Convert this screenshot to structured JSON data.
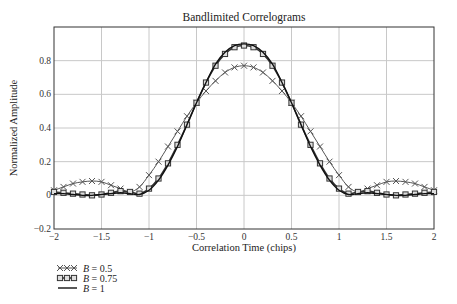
{
  "chart_data": {
    "type": "line",
    "title": "Bandlimited Correlograms",
    "xlabel": "Correlation Time (chips)",
    "ylabel": "Normalized Amplitude",
    "xlim": [
      -2,
      2
    ],
    "ylim": [
      -0.2,
      1.0
    ],
    "grid": true,
    "legend_position": "bottom-left, below plot",
    "x_ticks": [
      -2,
      -1.5,
      -1,
      -0.5,
      0,
      0.5,
      1,
      1.5,
      2
    ],
    "x_tick_labels": [
      "−2",
      "−1.5",
      "−1",
      "−0.5",
      "0",
      "0.5",
      "1",
      "1.5",
      "2"
    ],
    "y_ticks": [
      -0.2,
      0,
      0.2,
      0.4,
      0.6,
      0.8
    ],
    "y_tick_labels": [
      "−0.2",
      "0",
      "0.2",
      "0.4",
      "0.6",
      "0.8"
    ],
    "x": [
      -2.0,
      -1.9,
      -1.8,
      -1.7,
      -1.6,
      -1.5,
      -1.4,
      -1.3,
      -1.2,
      -1.1,
      -1.0,
      -0.9,
      -0.8,
      -0.7,
      -0.6,
      -0.5,
      -0.4,
      -0.3,
      -0.2,
      -0.1,
      0.0,
      0.1,
      0.2,
      0.3,
      0.4,
      0.5,
      0.6,
      0.7,
      0.8,
      0.9,
      1.0,
      1.1,
      1.2,
      1.3,
      1.4,
      1.5,
      1.6,
      1.7,
      1.8,
      1.9,
      2.0
    ],
    "series": [
      {
        "name": "B = 0.5",
        "marker": "x",
        "values": [
          0.03,
          0.05,
          0.07,
          0.08,
          0.085,
          0.08,
          0.06,
          0.04,
          0.02,
          0.05,
          0.12,
          0.2,
          0.29,
          0.38,
          0.47,
          0.55,
          0.62,
          0.68,
          0.73,
          0.76,
          0.77,
          0.76,
          0.73,
          0.68,
          0.62,
          0.55,
          0.47,
          0.38,
          0.29,
          0.2,
          0.12,
          0.05,
          0.02,
          0.04,
          0.06,
          0.08,
          0.085,
          0.08,
          0.07,
          0.05,
          0.03
        ]
      },
      {
        "name": "B = 0.75",
        "marker": "square",
        "values": [
          0.02,
          0.015,
          0.01,
          0.005,
          0.0,
          0.005,
          0.015,
          0.025,
          0.02,
          0.01,
          0.04,
          0.1,
          0.19,
          0.3,
          0.42,
          0.55,
          0.67,
          0.77,
          0.84,
          0.88,
          0.89,
          0.88,
          0.84,
          0.77,
          0.67,
          0.55,
          0.42,
          0.3,
          0.19,
          0.1,
          0.04,
          0.01,
          0.02,
          0.025,
          0.015,
          0.005,
          0.0,
          0.005,
          0.01,
          0.015,
          0.02
        ]
      },
      {
        "name": "B = 1",
        "marker": "none",
        "values": [
          0.01,
          0.01,
          0.005,
          0.0,
          0.0,
          0.005,
          0.01,
          0.015,
          0.01,
          0.005,
          0.03,
          0.09,
          0.18,
          0.29,
          0.42,
          0.55,
          0.67,
          0.78,
          0.85,
          0.89,
          0.9,
          0.89,
          0.85,
          0.78,
          0.67,
          0.55,
          0.42,
          0.29,
          0.18,
          0.09,
          0.03,
          0.005,
          0.01,
          0.015,
          0.01,
          0.005,
          0.0,
          0.0,
          0.005,
          0.01,
          0.01
        ]
      }
    ]
  },
  "legend": [
    {
      "symbol": "x",
      "label_var": "B",
      "label_rest": " = 0.5"
    },
    {
      "symbol": "square",
      "label_var": "B",
      "label_rest": " = 0.75"
    },
    {
      "symbol": "none",
      "label_var": "B",
      "label_rest": " = 1"
    }
  ]
}
